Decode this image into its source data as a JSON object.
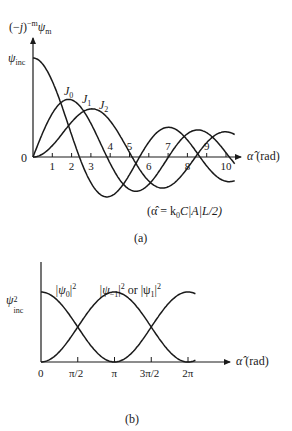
{
  "chart_data": [
    {
      "id": "a",
      "type": "line",
      "caption": "(a)",
      "ylabel": "(−j)^{−m} ψ_m",
      "y_marker_label": "ψ_inc",
      "xlabel": "α̂ (rad)",
      "note": "(α̂ = k₀C|A|L/2)",
      "x_ticks": [
        1,
        2,
        3,
        4,
        5,
        6,
        7,
        8,
        9,
        10
      ],
      "xlim": [
        0,
        10.5
      ],
      "ylim": [
        -0.45,
        1.2
      ],
      "origin_label": "0",
      "series": [
        {
          "name": "J0",
          "label": "J",
          "sub": "0",
          "function": "besselJ0",
          "x_range": [
            0,
            10.5
          ]
        },
        {
          "name": "J1",
          "label": "J",
          "sub": "1",
          "function": "besselJ1",
          "x_range": [
            0,
            10.5
          ]
        },
        {
          "name": "J2",
          "label": "J",
          "sub": "2",
          "function": "besselJ2",
          "x_range": [
            0,
            10.5
          ]
        }
      ],
      "grid": false,
      "legend": "inline labels"
    },
    {
      "id": "b",
      "type": "line",
      "caption": "(b)",
      "y_marker_label": "ψ²_inc",
      "xlabel": "α̂ (rad)",
      "x_ticks": [
        "0",
        "π/2",
        "π",
        "3π/2",
        "2π"
      ],
      "x_tick_values": [
        0,
        1.5708,
        3.1416,
        4.7124,
        6.2832
      ],
      "xlim": [
        0,
        7.1
      ],
      "ylim": [
        0,
        1.0
      ],
      "series": [
        {
          "name": "|ψ0|²",
          "label": "|ψ",
          "sub": "0",
          "suffix": "|²",
          "function": "cos^2(x/2)"
        },
        {
          "name": "|ψ−1|² or |ψ1|²",
          "label": "|ψ",
          "sub": "−1",
          "suffix": "|² or |ψ",
          "sub2": "1",
          "suffix2": "|²",
          "function": "sin^2(x/2)"
        }
      ],
      "grid": false,
      "legend": "inline labels"
    }
  ],
  "labels": {
    "a_ylabel_prefix": "(−",
    "a_ylabel_j": "j",
    "a_ylabel_close": ")",
    "a_ylabel_sup": "−m",
    "a_ylabel_psi": "ψ",
    "a_ylabel_sub": "m",
    "psi": "ψ",
    "inc": "inc",
    "two": "2",
    "zero": "0",
    "xlabel_alpha": "α̂",
    "xlabel_rad": " (rad)",
    "note": "(α̂ = k",
    "note_sub": "0",
    "note_rest": "C|A|L/2)",
    "caption_a": "(a)",
    "caption_b": "(b)",
    "J": "J",
    "J0_sub": "0",
    "J1_sub": "1",
    "J2_sub": "2",
    "b_l0_pre": "|ψ",
    "b_l0_sub": "0",
    "b_l0_post": "|",
    "b_l0_sup": "2",
    "b_l1_pre": "|ψ",
    "b_l1_sub": "−1",
    "b_l1_mid": "|",
    "b_l1_sup": "2",
    "b_l1_or": " or |ψ",
    "b_l1_sub2": "1",
    "b_l1_post": "|",
    "b_l1_sup2": "2"
  },
  "tick_labels_a": [
    "1",
    "2",
    "3",
    "4",
    "5",
    "6",
    "7",
    "8",
    "9",
    "10"
  ],
  "tick_labels_b": [
    "0",
    "π/2",
    "π",
    "3π/2",
    "2π"
  ],
  "colors": {
    "ink": "#1a1a1a",
    "background": "#ffffff"
  }
}
